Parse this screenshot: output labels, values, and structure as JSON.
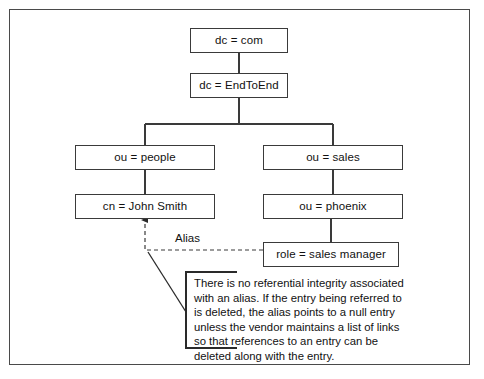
{
  "diagram": {
    "type": "ldap-directory-tree",
    "nodes": [
      {
        "id": "dc-com",
        "label": "dc = com",
        "x": 190,
        "y": 28,
        "w": 98,
        "h": 25
      },
      {
        "id": "dc-endtoend",
        "label": "dc = EndToEnd",
        "x": 190,
        "y": 73,
        "w": 98,
        "h": 25
      },
      {
        "id": "ou-people",
        "label": "ou = people",
        "x": 75,
        "h": 25,
        "y": 145,
        "w": 140
      },
      {
        "id": "ou-sales",
        "label": "ou = sales",
        "x": 263,
        "y": 145,
        "w": 140,
        "h": 25
      },
      {
        "id": "cn-john-smith",
        "label": "cn = John Smith",
        "x": 75,
        "y": 194,
        "w": 140,
        "h": 25
      },
      {
        "id": "ou-phoenix",
        "label": "ou = phoenix",
        "x": 263,
        "y": 194,
        "w": 140,
        "h": 25
      },
      {
        "id": "role-sales-manager",
        "label": "role = sales manager",
        "x": 263,
        "y": 242,
        "w": 136,
        "h": 25
      }
    ],
    "alias_label": "Alias",
    "callout": {
      "text": "There is no referential integrity associated with an alias. If the entry being referred to is deleted, the alias points to a null entry unless the vendor maintains a list of links so that references to an entry can be deleted along with the entry."
    },
    "colors": {
      "frame_border": "#4a4a4a",
      "node_border": "#3a3a3a",
      "connector": "#3a3a3a",
      "alias_line": "#3a3a3a",
      "background": "#ffffff",
      "text": "#111111"
    }
  }
}
